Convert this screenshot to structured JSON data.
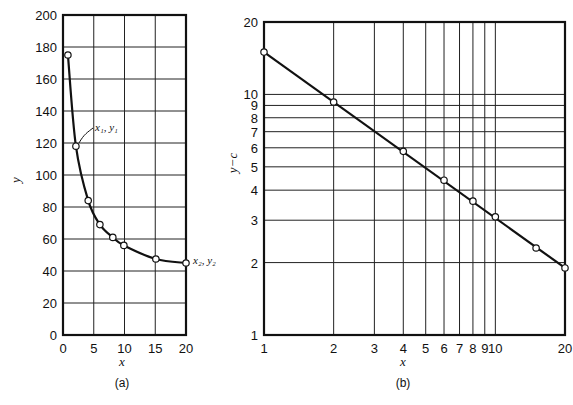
{
  "chart_data": [
    {
      "id": "a",
      "type": "line",
      "caption": "(a)",
      "title": "",
      "xlabel": "x",
      "ylabel": "y",
      "xscale": "linear",
      "yscale": "linear",
      "xlim": [
        0,
        20
      ],
      "ylim": [
        0,
        200
      ],
      "xticks": [
        0,
        5,
        10,
        15,
        20
      ],
      "yticks": [
        0,
        20,
        40,
        60,
        80,
        100,
        120,
        140,
        160,
        180,
        200
      ],
      "grid": true,
      "markers": "open-circle",
      "series": [
        {
          "name": "y vs x",
          "x": [
            0.8,
            2.1,
            4.1,
            6.0,
            8.1,
            9.9,
            15.1,
            20
          ],
          "y": [
            175,
            118,
            84,
            69,
            61,
            56,
            47.5,
            45
          ]
        }
      ],
      "annotations": [
        {
          "text": "x₁, y₁",
          "x": 2.1,
          "y": 118
        },
        {
          "text": "x₂, y₂",
          "x": 20,
          "y": 45
        }
      ]
    },
    {
      "id": "b",
      "type": "line",
      "caption": "(b)",
      "title": "",
      "xlabel": "x",
      "ylabel": "y−c",
      "xscale": "log",
      "yscale": "log",
      "xlim": [
        1,
        20
      ],
      "ylim": [
        1,
        20
      ],
      "xticks": [
        1,
        2,
        3,
        4,
        5,
        6,
        7,
        8,
        9,
        10,
        20
      ],
      "yticks": [
        1,
        2,
        3,
        4,
        5,
        6,
        7,
        8,
        9,
        10,
        20
      ],
      "grid": true,
      "markers": "open-circle",
      "series": [
        {
          "name": "y-c vs x",
          "x": [
            1,
            2,
            4,
            6,
            8,
            10,
            15,
            20
          ],
          "y": [
            15,
            9.3,
            5.8,
            4.4,
            3.6,
            3.1,
            2.3,
            1.9
          ]
        }
      ]
    }
  ],
  "labels": {
    "a_caption": "(a)",
    "b_caption": "(b)",
    "a_xlabel": "x",
    "a_ylabel": "y",
    "b_xlabel": "x",
    "b_ylabel": "y−c",
    "ann1": "x₁, y₁",
    "ann2": "x₂, y₂"
  }
}
